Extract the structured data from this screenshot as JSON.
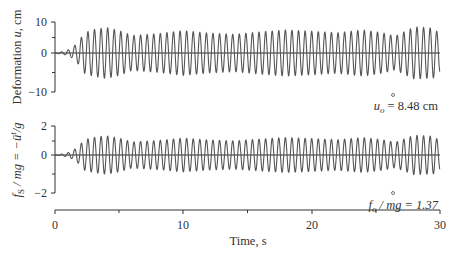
{
  "chart_data": [
    {
      "type": "line",
      "panel": "top",
      "title": "",
      "ylabel": "Deformation u, cm",
      "xlabel": "",
      "xlim": [
        0,
        30
      ],
      "ylim": [
        -10,
        10
      ],
      "yticks": [
        -10,
        0,
        10
      ],
      "ytick_labels": [
        "−10",
        "0",
        "10"
      ],
      "y_minor_ticks": [
        -5,
        5
      ],
      "grid": false,
      "zero_line": true,
      "annotation": {
        "text": "u_o = 8.48 cm",
        "label_main": "u",
        "label_sub": "o",
        "label_rest": " = 8.48 cm",
        "at_time": 28.5,
        "peak_value": -8.48
      },
      "description": "Steady oscillation beginning ~1 s, ~58 cycles over 30 s (frequency ≈ 2 Hz), amplitude ~6–8.5 cm with beating envelope",
      "envelope": {
        "time": [
          0,
          0.8,
          1.3,
          1.8,
          2.3,
          3.0,
          4.0,
          5.0,
          6.0,
          8.0,
          10.0,
          12.0,
          14.0,
          16.0,
          18.0,
          20.0,
          22.0,
          24.0,
          25.5,
          26.5,
          28.0,
          29.5,
          30.0
        ],
        "amplitude": [
          0,
          0.6,
          1.5,
          3.5,
          6.5,
          7.5,
          8.2,
          7.2,
          5.6,
          6.2,
          7.2,
          6.4,
          6.0,
          6.8,
          7.4,
          7.0,
          6.5,
          7.4,
          6.5,
          5.4,
          8.4,
          8.0,
          6.0
        ]
      },
      "peak_abs": 8.48,
      "approx_frequency_hz": 1.95
    },
    {
      "type": "line",
      "panel": "bottom",
      "title": "",
      "ylabel": "f_S / mg = −ü^t/g",
      "xlabel": "Time, s",
      "xlim": [
        0,
        30
      ],
      "ylim": [
        -2,
        2
      ],
      "yticks": [
        -2,
        0,
        2
      ],
      "ytick_labels": [
        "−2",
        "0",
        "2"
      ],
      "y_minor_ticks": [
        -1,
        1
      ],
      "xticks": [
        0,
        10,
        20,
        30
      ],
      "xtick_labels": [
        "0",
        "10",
        "20",
        "30"
      ],
      "x_minor_ticks": [
        5,
        15,
        25
      ],
      "grid": false,
      "zero_line": true,
      "annotation": {
        "text": "f_o / mg = 1.37",
        "label_main": "f",
        "label_sub": "o",
        "label_rest": " / mg = 1.37",
        "at_time": 28.5,
        "peak_value": -1.37
      },
      "description": "Same waveform shape as deformation scaled by ω²/g; peak 1.37",
      "envelope": {
        "time": [
          0,
          0.8,
          1.3,
          1.8,
          2.3,
          3.0,
          4.0,
          5.0,
          6.0,
          8.0,
          10.0,
          12.0,
          14.0,
          16.0,
          18.0,
          20.0,
          22.0,
          24.0,
          25.5,
          26.5,
          28.0,
          29.5,
          30.0
        ],
        "amplitude": [
          0,
          0.1,
          0.25,
          0.56,
          1.05,
          1.21,
          1.32,
          1.16,
          0.9,
          1.0,
          1.16,
          1.03,
          0.97,
          1.1,
          1.2,
          1.13,
          1.05,
          1.2,
          1.05,
          0.87,
          1.36,
          1.29,
          0.97
        ]
      },
      "peak_abs": 1.37,
      "approx_frequency_hz": 1.95
    }
  ],
  "labels": {
    "top_ylabel_pre": "Deformation ",
    "top_ylabel_var": "u",
    "top_ylabel_post": ", cm",
    "bottom_ylabel_f": "f",
    "bottom_ylabel_S": "S",
    "bottom_ylabel_rest": " / mg = −ü",
    "bottom_ylabel_t": "t",
    "bottom_ylabel_end": "/g",
    "xlabel": "Time, s",
    "top_annot_main": "u",
    "top_annot_sub": "o",
    "top_annot_rest": " = 8.48 cm",
    "bottom_annot_main": "f",
    "bottom_annot_sub": "o",
    "bottom_annot_rest": " / mg = 1.37",
    "top_yt_pos": "10",
    "top_yt_zero": "0",
    "top_yt_neg": "−10",
    "bot_yt_pos": "2",
    "bot_yt_zero": "0",
    "bot_yt_neg": "−2",
    "xt_0": "0",
    "xt_10": "10",
    "xt_20": "20",
    "xt_30": "30"
  },
  "colors": {
    "signal": "#555555",
    "axis": "#333333",
    "zero_line": "#222222"
  }
}
